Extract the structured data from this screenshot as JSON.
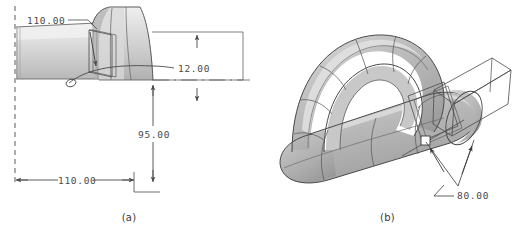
{
  "figure": {
    "background_color": "#ffffff",
    "line_color": "#4a4a4a",
    "shade_light": "#e9e9e9",
    "shade_mid": "#c9c9c9",
    "shade_dark": "#9a9a9a"
  },
  "panels": [
    {
      "id": "a",
      "caption": "(a)",
      "view": "orthographic side view of swept tube with flared end",
      "dimensions": [
        {
          "name": "top-leader-dimension",
          "value": "110.00",
          "orientation": "leader"
        },
        {
          "name": "vertical-small-dimension",
          "value": "12.00",
          "orientation": "vertical"
        },
        {
          "name": "vertical-large-dimension",
          "value": "95.00",
          "orientation": "vertical"
        },
        {
          "name": "horizontal-dimension",
          "value": "110.00",
          "orientation": "horizontal"
        }
      ]
    },
    {
      "id": "b",
      "caption": "(b)",
      "view": "isometric shaded view of looped handle solid with wireframe prism",
      "dimensions": [
        {
          "name": "angle-dimension",
          "value": "80.00",
          "orientation": "leader"
        }
      ]
    }
  ]
}
